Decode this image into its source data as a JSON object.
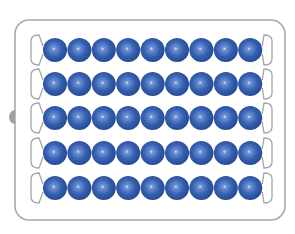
{
  "illustration": {
    "subject": "bead frame (abacus)",
    "rows": 5,
    "beads_per_row": 9,
    "total_beads": 45
  },
  "colors": {
    "background": "#ffffff",
    "frame_stroke": "#a9a9a9",
    "wire_stroke": "#a5a5a5",
    "knob": "#a0a0a0",
    "bead_dark": "#22468f",
    "bead_mid": "#3560b0",
    "bead_light": "#6f93d6",
    "bead_highlight": "#e6eefc"
  },
  "layout": {
    "frame": {
      "x": 15,
      "y": 20,
      "width": 270,
      "height": 200,
      "radius": 14
    },
    "bead_start_x": 55,
    "bead_spacing_x": 24.4,
    "bead_radius": 12,
    "row_y": [
      50,
      84,
      118,
      153,
      188
    ],
    "wire_left_x": 31,
    "wire_right_x": 272
  }
}
